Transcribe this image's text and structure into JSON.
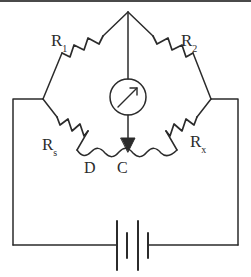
{
  "figure": {
    "type": "circuit-diagram",
    "name": "Wheatstone bridge with slide wire",
    "background_color": "#ffffff",
    "line_color": "#2b2b2b"
  },
  "labels": {
    "r1": {
      "base": "R",
      "subscript": "1",
      "full": "R1"
    },
    "r2": {
      "base": "R",
      "subscript": "2",
      "full": "R2"
    },
    "rs": {
      "base": "R",
      "subscript": "s",
      "full": "Rs"
    },
    "rx": {
      "base": "R",
      "subscript": "x",
      "full": "Rx"
    },
    "node_d": "D",
    "node_c": "C"
  },
  "components": {
    "galvanometer": {
      "name": "galvanometer",
      "shape": "circle-with-needle",
      "needle_direction": "up-right"
    },
    "battery": {
      "name": "battery",
      "plates": 4,
      "plate_pattern": "long-short-long-short"
    },
    "slide_wire": {
      "name": "slide-wire",
      "shape": "wavy"
    },
    "contact_pointer": {
      "name": "sliding-contact-arrow",
      "direction": "down",
      "target_node": "C"
    },
    "resistors": [
      "R1",
      "R2",
      "Rs",
      "Rx"
    ]
  }
}
